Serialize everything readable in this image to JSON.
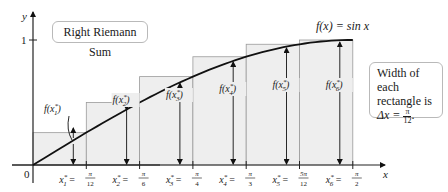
{
  "title_box": {
    "label": "Right Riemann Sum"
  },
  "width_box": {
    "line1": "Width of each",
    "line2": "rectangle is",
    "delta_prefix": "Δx =",
    "delta_num": "π",
    "delta_den": "12",
    "delta_suffix": "."
  },
  "function_label": "f(x) = sin x",
  "axes": {
    "x_label": "x",
    "y_label": "y",
    "origin_label": "0",
    "y_tick_label": "1"
  },
  "points": [
    {
      "name": "x1*",
      "sub": "1",
      "value_num": "π",
      "value_den": "12",
      "f_label_sub": "1"
    },
    {
      "name": "x2*",
      "sub": "2",
      "value_num": "π",
      "value_den": "6",
      "f_label_sub": "2"
    },
    {
      "name": "x3*",
      "sub": "3",
      "value_num": "π",
      "value_den": "4",
      "f_label_sub": "3"
    },
    {
      "name": "x4*",
      "sub": "4",
      "value_num": "π",
      "value_den": "3",
      "f_label_sub": "4"
    },
    {
      "name": "x5*",
      "sub": "5",
      "value_num": "5π",
      "value_den": "12",
      "f_label_sub": "5"
    },
    {
      "name": "x6*",
      "sub": "6",
      "value_num": "π",
      "value_den": "2",
      "f_label_sub": "6"
    }
  ],
  "colors": {
    "rect_fill": "#eeeeee",
    "rect_stroke": "#9a9a9a",
    "curve": "#111111",
    "axis": "#222222",
    "box_border": "#b9b9b9"
  },
  "chart_data": {
    "type": "area",
    "title": "Right Riemann Sum",
    "function": "sin x",
    "interval": [
      0,
      1.5708
    ],
    "n": 6,
    "dx": "π/12",
    "x": [
      0.2618,
      0.5236,
      0.7854,
      1.0472,
      1.309,
      1.5708
    ],
    "x_tick_labels": [
      "x1* = π/12",
      "x2* = π/6",
      "x3* = π/4",
      "x4* = π/3",
      "x5* = 5π/12",
      "x6* = π/2"
    ],
    "values": [
      0.2588,
      0.5,
      0.7071,
      0.866,
      0.9659,
      1.0
    ],
    "xlabel": "x",
    "ylabel": "y",
    "ylim": [
      0,
      1.05
    ],
    "y_ticks": [
      1
    ],
    "annotations": [
      "f(x) = sin x",
      "Width of each rectangle is Δx = π/12.",
      "f(x1*)",
      "f(x2*)",
      "f(x3*)",
      "f(x4*)",
      "f(x5*)",
      "f(x6*)"
    ]
  }
}
